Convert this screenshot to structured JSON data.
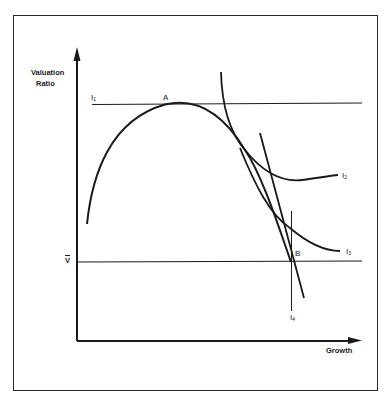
{
  "figure": {
    "y_axis_label_line1": "Valuation",
    "y_axis_label_line2": "Ratio",
    "x_axis_label": "Growth",
    "point_a_label": "A",
    "point_b_label": "B",
    "v_bar_label": "V",
    "curves": {
      "i1": {
        "base": "I",
        "sub": "1"
      },
      "i2": {
        "base": "I",
        "sub": "2"
      },
      "i3": {
        "base": "I",
        "sub": "3"
      },
      "i4": {
        "base": "I",
        "sub": "4"
      }
    },
    "colors": {
      "ink": "#1a1a1a",
      "background": "#ffffff"
    }
  }
}
